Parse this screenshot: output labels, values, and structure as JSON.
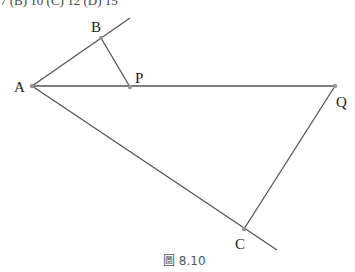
{
  "top_text": "7 (B) 10   (C) 12   (D) 15",
  "figure": {
    "caption": "圖 8.10",
    "line_color": "#555555",
    "point_color": "#999999",
    "points": {
      "A": {
        "label": "A",
        "x": 32,
        "y": 86
      },
      "B": {
        "label": "B",
        "x": 101,
        "y": 38
      },
      "P": {
        "label": "P",
        "x": 130,
        "y": 87
      },
      "Q": {
        "label": "Q",
        "x": 335,
        "y": 86
      },
      "C": {
        "label": "C",
        "x": 244,
        "y": 229
      }
    }
  }
}
